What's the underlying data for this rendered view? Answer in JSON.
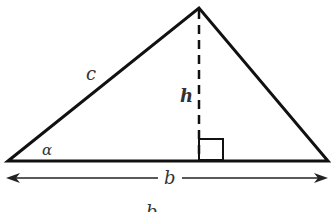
{
  "diagram": {
    "type": "triangle-with-height",
    "labels": {
      "side": "c",
      "height": "h",
      "angle": "α",
      "base": "b",
      "caption_partial": "b"
    },
    "colors": {
      "stroke": "#111111",
      "text": "#333333",
      "background": "#ffffff"
    }
  }
}
